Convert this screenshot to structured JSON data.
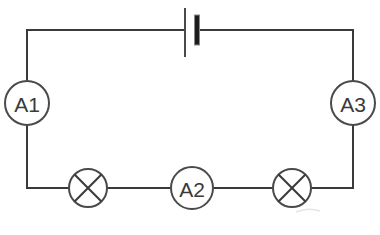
{
  "diagram": {
    "background_color": "#ffffff",
    "wire_color": "#3a3a3a",
    "label_color": "#3a3a3a",
    "battery_plate_color": "#1c1c1c"
  },
  "loop": {
    "left_x": 27,
    "right_x": 353,
    "top_y": 30,
    "bottom_y": 188
  },
  "battery": {
    "name": "cell",
    "icon": "battery-cell-icon",
    "center_x": 191,
    "long_plate_x": 185,
    "long_plate_top": 8,
    "long_plate_bottom": 57,
    "short_plate_x": 197,
    "short_plate_top": 15,
    "short_plate_bottom": 45,
    "short_plate_width": 5
  },
  "meters": [
    {
      "id": "a1",
      "label": "A1",
      "icon": "ammeter-icon",
      "cx": 27,
      "cy": 103,
      "r": 22
    },
    {
      "id": "a2",
      "label": "A2",
      "icon": "ammeter-icon",
      "cx": 192,
      "cy": 188,
      "r": 21
    },
    {
      "id": "a3",
      "label": "A3",
      "icon": "ammeter-icon",
      "cx": 353,
      "cy": 103,
      "r": 22
    }
  ],
  "lamps": [
    {
      "id": "lamp-left",
      "icon": "lamp-icon",
      "cx": 88,
      "cy": 188,
      "r": 19
    },
    {
      "id": "lamp-right",
      "icon": "lamp-icon",
      "cx": 292,
      "cy": 188,
      "r": 19
    }
  ]
}
